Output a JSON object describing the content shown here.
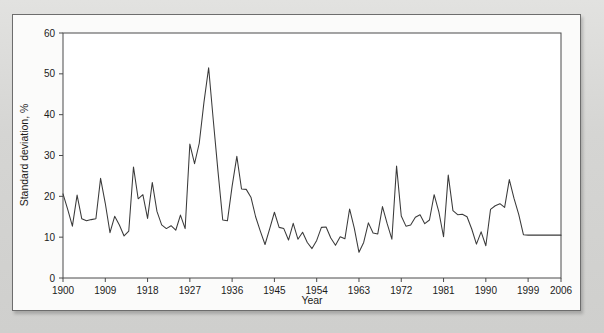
{
  "figure": {
    "background_color": "#d8d8d6",
    "card_color": "#fbfbfa",
    "border_color": "#6d6d6d",
    "line_color": "#3a3a3a",
    "axis_color": "#3a3a3a"
  },
  "axes": {
    "x_title": "Year",
    "y_title": "Standard deviation, %",
    "x_ticks": [
      "1900",
      "1909",
      "1918",
      "1927",
      "1936",
      "1945",
      "1954",
      "1963",
      "1972",
      "1981",
      "1990",
      "1999",
      "2006"
    ],
    "y_ticks": [
      "0",
      "10",
      "20",
      "30",
      "40",
      "50",
      "60"
    ]
  },
  "chart_data": {
    "type": "line",
    "title": "",
    "subtitle": "",
    "xlabel": "Year",
    "ylabel": "Standard deviation, %",
    "xlim": [
      1900,
      2006
    ],
    "ylim": [
      0,
      60
    ],
    "xticks": [
      1900,
      1909,
      1918,
      1927,
      1936,
      1945,
      1954,
      1963,
      1972,
      1981,
      1990,
      1999,
      2006
    ],
    "yticks": [
      0,
      10,
      20,
      30,
      40,
      50,
      60
    ],
    "grid": false,
    "legend": null,
    "legend_position": "none",
    "annotations": [],
    "series": [
      {
        "name": "Standard deviation, %",
        "color": "#3a3a3a",
        "x": [
          1900,
          1901,
          1902,
          1903,
          1904,
          1905,
          1906,
          1907,
          1908,
          1909,
          1910,
          1911,
          1912,
          1913,
          1914,
          1915,
          1916,
          1917,
          1918,
          1919,
          1920,
          1921,
          1922,
          1923,
          1924,
          1925,
          1926,
          1927,
          1928,
          1929,
          1930,
          1931,
          1932,
          1933,
          1934,
          1935,
          1936,
          1937,
          1938,
          1939,
          1940,
          1941,
          1942,
          1943,
          1944,
          1945,
          1946,
          1947,
          1948,
          1949,
          1950,
          1951,
          1952,
          1953,
          1954,
          1955,
          1956,
          1957,
          1958,
          1959,
          1960,
          1961,
          1962,
          1963,
          1964,
          1965,
          1966,
          1967,
          1968,
          1969,
          1970,
          1971,
          1972,
          1973,
          1974,
          1975,
          1976,
          1977,
          1978,
          1979,
          1980,
          1981,
          1982,
          1983,
          1984,
          1985,
          1986,
          1987,
          1988,
          1989,
          1990,
          1991,
          1992,
          1993,
          1994,
          1995,
          1996,
          1997,
          1998,
          1999,
          2000,
          2001,
          2002,
          2003,
          2004,
          2005,
          2006
        ],
        "y": [
          20.6,
          16.8,
          12.7,
          20.3,
          14.5,
          14.0,
          14.3,
          14.5,
          24.4,
          18.3,
          11.1,
          15.1,
          13.0,
          10.3,
          11.5,
          27.2,
          19.4,
          20.4,
          14.6,
          23.4,
          16.3,
          13.0,
          12.1,
          12.8,
          11.7,
          15.4,
          12.1,
          32.8,
          28.0,
          33.0,
          43.0,
          51.5,
          38.5,
          26.0,
          14.2,
          14.0,
          22.5,
          29.8,
          21.8,
          21.7,
          19.8,
          15.0,
          11.5,
          8.2,
          12.1,
          16.1,
          12.4,
          12.1,
          9.3,
          13.4,
          9.5,
          11.2,
          8.7,
          7.2,
          9.2,
          12.4,
          12.5,
          9.8,
          8.0,
          10.1,
          9.6,
          16.9,
          12.2,
          6.3,
          8.7,
          13.5,
          11.0,
          10.8,
          17.5,
          13.3,
          9.5,
          27.4,
          15.2,
          12.7,
          13.0,
          14.9,
          15.5,
          13.3,
          14.2,
          20.4,
          16.2,
          10.1,
          25.2,
          16.5,
          15.5,
          15.6,
          15.0,
          12.0,
          8.3,
          11.3,
          7.9,
          16.8,
          17.7,
          18.2,
          17.3,
          24.1,
          19.5,
          15.6,
          10.6,
          10.5,
          10.5,
          10.5,
          10.5,
          10.5,
          10.5,
          10.5,
          10.5
        ]
      }
    ]
  }
}
